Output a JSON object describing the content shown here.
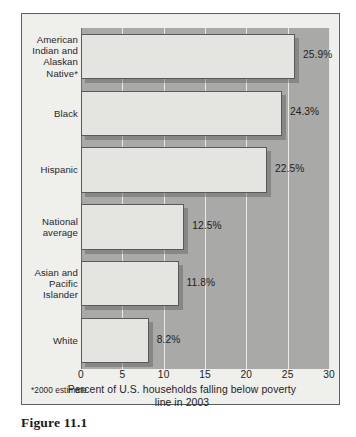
{
  "figure": {
    "caption": "Figure 11.1",
    "footnote": "*2000 estimate"
  },
  "chart_data": {
    "type": "bar",
    "orientation": "horizontal",
    "title": "",
    "xlabel": "Percent of U.S. households falling below poverty line in 2003",
    "ylabel": "",
    "xlim": [
      0,
      30
    ],
    "xticks": [
      0,
      5,
      10,
      15,
      20,
      25,
      30
    ],
    "xtick_labels": [
      "0",
      "5",
      "10",
      "15",
      "20",
      "25",
      "30"
    ],
    "grid": true,
    "grid_axis": "x",
    "legend": null,
    "categories": [
      "American\nIndian and\nAlaskan\nNative*",
      "Black",
      "Hispanic",
      "National\naverage",
      "Asian and\nPacific\nIslander",
      "White"
    ],
    "values": [
      25.9,
      24.3,
      22.5,
      12.5,
      11.8,
      8.2
    ],
    "value_labels": [
      "25.9%",
      "24.3%",
      "22.5%",
      "12.5%",
      "11.8%",
      "8.2%"
    ],
    "annotations": [
      "*2000 estimate"
    ],
    "colors": {
      "bar_fill": "#e4e4e0",
      "bar_edge": "#5a5a5a",
      "plot_background": "#a9a9a7",
      "gridline": "#e9e9e6",
      "figure_background": "#efefec",
      "frame": "#5f5f5f",
      "text": "#1e1e22"
    }
  }
}
